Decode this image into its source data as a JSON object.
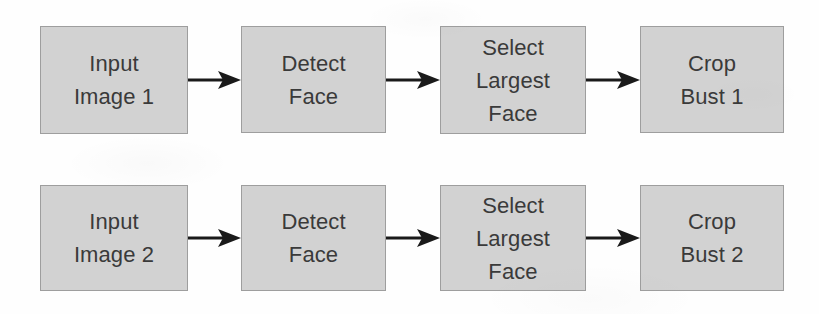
{
  "diagram": {
    "type": "flowchart",
    "background_color": "#fefefe",
    "node_fill_color": "#d2d2d2",
    "node_border_color": "#9e9e9e",
    "text_color": "#3a3a3a",
    "arrow_color": "#1a1a1a",
    "rows": [
      {
        "id": "pipeline-1",
        "nodes": [
          {
            "id": "input-image-1",
            "lines": [
              "Input",
              "Image 1"
            ]
          },
          {
            "id": "detect-face-1",
            "lines": [
              "Detect",
              "Face"
            ]
          },
          {
            "id": "select-largest-face-1",
            "lines": [
              "Select",
              "Largest",
              "Face"
            ]
          },
          {
            "id": "crop-bust-1",
            "lines": [
              "Crop",
              "Bust 1"
            ]
          }
        ],
        "arrows": [
          {
            "id": "arrow-1-1",
            "from": "input-image-1",
            "to": "detect-face-1"
          },
          {
            "id": "arrow-1-2",
            "from": "detect-face-1",
            "to": "select-largest-face-1"
          },
          {
            "id": "arrow-1-3",
            "from": "select-largest-face-1",
            "to": "crop-bust-1"
          }
        ]
      },
      {
        "id": "pipeline-2",
        "nodes": [
          {
            "id": "input-image-2",
            "lines": [
              "Input",
              "Image 2"
            ]
          },
          {
            "id": "detect-face-2",
            "lines": [
              "Detect",
              "Face"
            ]
          },
          {
            "id": "select-largest-face-2",
            "lines": [
              "Select",
              "Largest",
              "Face"
            ]
          },
          {
            "id": "crop-bust-2",
            "lines": [
              "Crop",
              "Bust 2"
            ]
          }
        ],
        "arrows": [
          {
            "id": "arrow-2-1",
            "from": "input-image-2",
            "to": "detect-face-2"
          },
          {
            "id": "arrow-2-2",
            "from": "detect-face-2",
            "to": "select-largest-face-2"
          },
          {
            "id": "arrow-2-3",
            "from": "select-largest-face-2",
            "to": "crop-bust-2"
          }
        ]
      }
    ]
  }
}
